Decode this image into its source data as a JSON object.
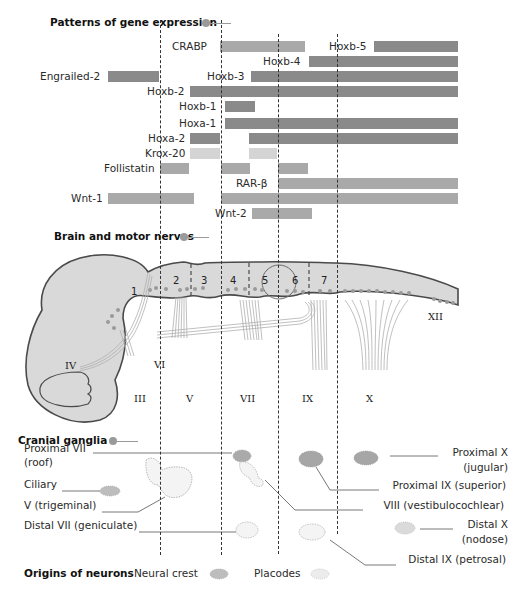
{
  "sections": {
    "gene_expression": {
      "title": "Patterns of gene expression"
    },
    "brain_nerves": {
      "title": "Brain and motor nerves"
    },
    "cranial_ganglia": {
      "title": "Cranial ganglia"
    },
    "origins": {
      "title": "Origins of neurons",
      "neural_crest_label": "Neural crest",
      "placodes_label": "Placodes"
    }
  },
  "colors": {
    "dark_bar": "#8a8a8a",
    "mid_bar": "#a9a9a9",
    "light_bar": "#d4d4d4",
    "embryo_fill": "#d9d9d9",
    "embryo_outline": "#4a4a4a"
  },
  "genes": [
    {
      "name": "CRABP",
      "label_x": 172,
      "y": 41,
      "bars": [
        {
          "x1": 220,
          "x2": 305,
          "tone": "mid"
        }
      ]
    },
    {
      "name": "Hoxb-5",
      "label_x": 329,
      "y": 41,
      "bars": [
        {
          "x1": 374,
          "x2": 458,
          "tone": "dark"
        }
      ]
    },
    {
      "name": "Hoxb-4",
      "label_x": 263,
      "y": 56,
      "bars": [
        {
          "x1": 309,
          "x2": 458,
          "tone": "dark"
        }
      ]
    },
    {
      "name": "Engrailed-2",
      "label_x": 40,
      "y": 71,
      "bars": [
        {
          "x1": 108,
          "x2": 159,
          "tone": "dark"
        }
      ]
    },
    {
      "name": "Hoxb-3",
      "label_x": 207,
      "y": 71,
      "bars": [
        {
          "x1": 251,
          "x2": 458,
          "tone": "dark"
        }
      ]
    },
    {
      "name": "Hoxb-2",
      "label_x": 147,
      "y": 86,
      "bars": [
        {
          "x1": 190,
          "x2": 458,
          "tone": "dark"
        }
      ]
    },
    {
      "name": "Hoxb-1",
      "label_x": 179,
      "y": 101,
      "bars": [
        {
          "x1": 225,
          "x2": 255,
          "tone": "dark"
        }
      ]
    },
    {
      "name": "Hoxa-1",
      "label_x": 179,
      "y": 118,
      "bars": [
        {
          "x1": 225,
          "x2": 458,
          "tone": "dark"
        }
      ]
    },
    {
      "name": "Hoxa-2",
      "label_x": 148,
      "y": 133,
      "bars": [
        {
          "x1": 190,
          "x2": 220,
          "tone": "dark"
        },
        {
          "x1": 249,
          "x2": 458,
          "tone": "dark"
        }
      ]
    },
    {
      "name": "Krox-20",
      "label_x": 145,
      "y": 148,
      "bars": [
        {
          "x1": 190,
          "x2": 220,
          "tone": "light"
        },
        {
          "x1": 249,
          "x2": 277,
          "tone": "light"
        }
      ]
    },
    {
      "name": "Follistatin",
      "label_x": 104,
      "y": 163,
      "bars": [
        {
          "x1": 160,
          "x2": 189,
          "tone": "mid"
        },
        {
          "x1": 221,
          "x2": 250,
          "tone": "mid"
        },
        {
          "x1": 278,
          "x2": 308,
          "tone": "mid"
        }
      ]
    },
    {
      "name": "RAR-β",
      "label_x": 236,
      "y": 178,
      "bars": [
        {
          "x1": 278,
          "x2": 458,
          "tone": "mid"
        }
      ]
    },
    {
      "name": "Wnt-1",
      "label_x": 71,
      "y": 193,
      "bars": [
        {
          "x1": 108,
          "x2": 194,
          "tone": "mid"
        },
        {
          "x1": 221,
          "x2": 458,
          "tone": "mid"
        }
      ]
    },
    {
      "name": "Wnt-2",
      "label_x": 215,
      "y": 208,
      "bars": [
        {
          "x1": 252,
          "x2": 312,
          "tone": "mid"
        }
      ]
    }
  ],
  "boundaries_x": [
    160,
    221,
    278,
    337
  ],
  "brain": {
    "rhombomeres": [
      "1",
      "2",
      "3",
      "4",
      "5",
      "6",
      "7"
    ],
    "nerves_top": [
      "IV",
      "VI",
      "XII"
    ],
    "nerves_bottom": [
      "III",
      "V",
      "VII",
      "IX",
      "X"
    ]
  },
  "ganglia": {
    "left_labels": [
      {
        "text": "Proximal VII",
        "x": 24,
        "y": 449
      },
      {
        "text": "(roof)",
        "x": 24,
        "y": 463
      },
      {
        "text": "Ciliary",
        "x": 24,
        "y": 485
      },
      {
        "text": "V (trigeminal)",
        "x": 24,
        "y": 506
      },
      {
        "text": "Distal VII (geniculate)",
        "x": 24,
        "y": 526
      }
    ],
    "right_labels": [
      {
        "text": "Proximal X",
        "right": 510,
        "y": 453
      },
      {
        "text": "(jugular)",
        "right": 510,
        "y": 468
      },
      {
        "text": "Proximal IX (superior)",
        "right": 508,
        "y": 486
      },
      {
        "text": "VIII (vestibulocochlear)",
        "right": 506,
        "y": 506
      },
      {
        "text": "Distal X",
        "right": 510,
        "y": 525
      },
      {
        "text": "(nodose)",
        "right": 510,
        "y": 540
      },
      {
        "text": "Distal IX (petrosal)",
        "right": 508,
        "y": 560
      }
    ]
  }
}
